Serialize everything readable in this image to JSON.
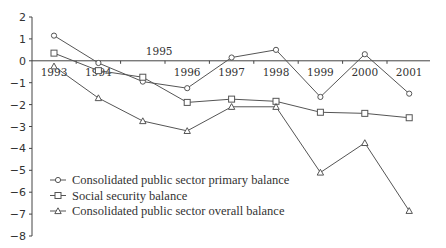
{
  "chart_data": {
    "type": "line",
    "title": "",
    "xlabel": "",
    "ylabel": "",
    "ylim": [
      -8,
      2
    ],
    "yticks": [
      2,
      1,
      0,
      -1,
      -2,
      -3,
      -4,
      -5,
      -6,
      -7,
      -8
    ],
    "ytick_labels": [
      "2",
      "1",
      "0",
      "−1",
      "−2",
      "−3",
      "−4",
      "−5",
      "−6",
      "−7",
      "−8"
    ],
    "x": [
      "1993",
      "1994",
      "1995",
      "1996",
      "1997",
      "1998",
      "1999",
      "2000",
      "2001"
    ],
    "grid": false,
    "legend_position": "bottom-left",
    "series": [
      {
        "name": "Consolidated public sector primary balance",
        "marker": "diamond",
        "values": [
          1.15,
          -0.1,
          -0.95,
          -1.25,
          0.15,
          0.5,
          -1.65,
          0.3,
          -1.5
        ]
      },
      {
        "name": "Social security balance",
        "marker": "square",
        "values": [
          0.35,
          -0.45,
          -0.75,
          -1.9,
          -1.75,
          -1.85,
          -2.35,
          -2.4,
          -2.6
        ]
      },
      {
        "name": "Consolidated public sector overall balance",
        "marker": "triangle",
        "values": [
          -0.25,
          -1.7,
          -2.75,
          -3.2,
          -2.1,
          -2.1,
          -5.1,
          -3.75,
          -6.85
        ]
      }
    ]
  }
}
